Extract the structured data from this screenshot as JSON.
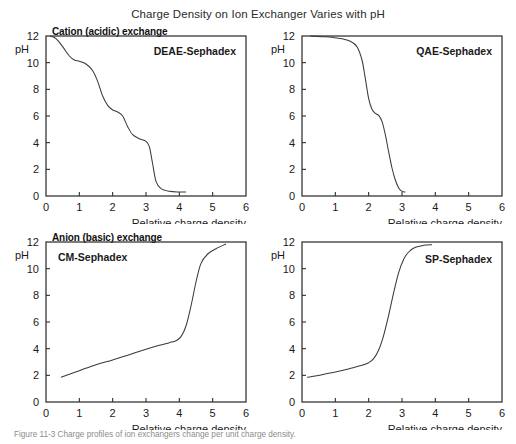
{
  "figure": {
    "title": "Charge Density on Ion Exchanger Varies with pH",
    "caption": "Figure 11-3  Charge profiles of ion exchangers change per unit charge density.",
    "section_headers": [
      {
        "label": "Cation (acidic) exchange"
      },
      {
        "label": "Anion (basic) exchange"
      }
    ]
  },
  "axes": {
    "xlabel": "Relative charge density",
    "ylabel": "pH",
    "xticks": [
      "0",
      "1",
      "2",
      "3",
      "4",
      "5",
      "6"
    ],
    "yticks": [
      "0",
      "2",
      "4",
      "6",
      "8",
      "10",
      "12"
    ]
  },
  "chart_data": [
    {
      "type": "line",
      "title": "DEAE-Sephadex",
      "xlabel": "Relative charge density",
      "ylabel": "pH",
      "xlim": [
        0,
        6
      ],
      "ylim": [
        0,
        12
      ],
      "xticks": [
        0,
        1,
        2,
        3,
        4,
        5,
        6
      ],
      "yticks": [
        0,
        2,
        4,
        6,
        8,
        10,
        12
      ],
      "grid": false,
      "legend": "none",
      "annotation": "DEAE-Sephadex",
      "x": [
        0.12,
        0.3,
        0.5,
        0.7,
        0.85,
        1.0,
        1.2,
        1.4,
        1.55,
        1.7,
        1.85,
        2.0,
        2.15,
        2.3,
        2.45,
        2.6,
        2.8,
        3.0,
        3.1,
        3.2,
        3.3,
        3.45,
        3.7,
        4.0,
        4.2
      ],
      "y": [
        12.0,
        11.8,
        11.2,
        10.5,
        10.2,
        10.1,
        9.9,
        9.4,
        8.6,
        7.5,
        6.8,
        6.45,
        6.3,
        6.0,
        5.2,
        4.6,
        4.3,
        4.1,
        3.7,
        2.4,
        1.1,
        0.55,
        0.35,
        0.3,
        0.3
      ]
    },
    {
      "type": "line",
      "title": "QAE-Sephadex",
      "xlabel": "Relative charge density",
      "ylabel": "pH",
      "xlim": [
        0,
        6
      ],
      "ylim": [
        0,
        12
      ],
      "xticks": [
        0,
        1,
        2,
        3,
        4,
        5,
        6
      ],
      "yticks": [
        0,
        2,
        4,
        6,
        8,
        10,
        12
      ],
      "grid": false,
      "legend": "none",
      "annotation": "QAE-Sephadex",
      "x": [
        0.25,
        0.6,
        0.9,
        1.2,
        1.45,
        1.65,
        1.8,
        1.9,
        2.0,
        2.1,
        2.2,
        2.3,
        2.4,
        2.5,
        2.6,
        2.7,
        2.8,
        2.9,
        3.0,
        3.1
      ],
      "y": [
        12.0,
        11.95,
        11.9,
        11.8,
        11.6,
        11.2,
        10.2,
        8.8,
        7.3,
        6.5,
        6.2,
        6.05,
        5.6,
        4.6,
        3.3,
        2.1,
        1.2,
        0.6,
        0.35,
        0.3
      ]
    },
    {
      "type": "line",
      "title": "CM-Sephadex",
      "xlabel": "Relative charge density",
      "ylabel": "pH",
      "xlim": [
        0,
        6
      ],
      "ylim": [
        0,
        12
      ],
      "xticks": [
        0,
        1,
        2,
        3,
        4,
        5,
        6
      ],
      "yticks": [
        0,
        2,
        4,
        6,
        8,
        10,
        12
      ],
      "grid": false,
      "legend": "none",
      "annotation": "CM-Sephadex",
      "x": [
        0.45,
        1.0,
        1.5,
        2.0,
        2.5,
        3.0,
        3.4,
        3.7,
        3.9,
        4.05,
        4.2,
        4.35,
        4.5,
        4.65,
        4.85,
        5.1,
        5.4
      ],
      "y": [
        1.85,
        2.35,
        2.8,
        3.15,
        3.55,
        3.95,
        4.25,
        4.45,
        4.6,
        4.9,
        5.7,
        7.2,
        9.0,
        10.4,
        11.1,
        11.5,
        11.85
      ]
    },
    {
      "type": "line",
      "title": "SP-Sephadex",
      "xlabel": "Relative charge density",
      "ylabel": "pH",
      "xlim": [
        0,
        6
      ],
      "ylim": [
        0,
        12
      ],
      "xticks": [
        0,
        1,
        2,
        3,
        4,
        5,
        6
      ],
      "yticks": [
        0,
        2,
        4,
        6,
        8,
        10,
        12
      ],
      "grid": false,
      "legend": "none",
      "annotation": "SP-Sephadex",
      "x": [
        0.15,
        0.6,
        1.1,
        1.5,
        1.8,
        2.0,
        2.15,
        2.3,
        2.45,
        2.6,
        2.75,
        2.9,
        3.05,
        3.2,
        3.4,
        3.65,
        3.9
      ],
      "y": [
        1.85,
        2.05,
        2.3,
        2.55,
        2.75,
        2.95,
        3.25,
        3.9,
        5.0,
        6.5,
        8.2,
        9.7,
        10.7,
        11.25,
        11.6,
        11.75,
        11.8
      ]
    }
  ],
  "colors": {
    "curve": "#3a3a3a",
    "frame": "#2f2f2f",
    "text": "#1a1a1a",
    "caption": "#8c8c8c"
  }
}
